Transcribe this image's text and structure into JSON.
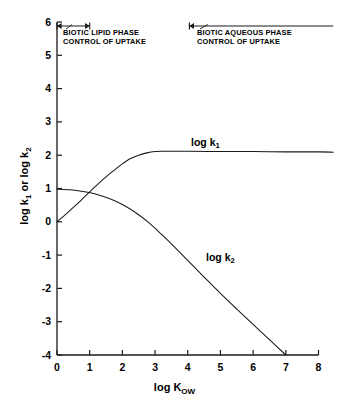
{
  "chart_data": {
    "type": "line",
    "title": "",
    "xlabel": "log K",
    "xlabel_sub": "OW",
    "ylabel": "log k",
    "ylabel_sub1": "1",
    "ylabel_mid": " or log k",
    "ylabel_sub2": "2",
    "xlim": [
      0,
      8
    ],
    "ylim": [
      -4,
      6
    ],
    "xticks": [
      "0",
      "1",
      "2",
      "3",
      "4",
      "5",
      "6",
      "7",
      "8"
    ],
    "yticks": [
      "6",
      "5",
      "4",
      "3",
      "2",
      "1",
      "0",
      "-1",
      "-2",
      "-3",
      "-4"
    ],
    "grid": false,
    "legend_position": "inline-curve-labels",
    "series": [
      {
        "name": "log k1",
        "label": "log k",
        "label_sub": "1",
        "color": "#1a1a1a",
        "x": [
          0.0,
          0.25,
          0.5,
          0.75,
          1.0,
          1.25,
          1.5,
          1.75,
          2.0,
          2.25,
          2.5,
          2.75,
          3.0,
          3.25,
          3.5,
          4.0,
          5.0,
          6.0,
          7.0,
          8.0,
          8.45
        ],
        "y": [
          0.0,
          0.21,
          0.43,
          0.66,
          0.9,
          1.13,
          1.35,
          1.55,
          1.74,
          1.9,
          2.0,
          2.07,
          2.11,
          2.12,
          2.12,
          2.12,
          2.11,
          2.11,
          2.1,
          2.1,
          2.09
        ]
      },
      {
        "name": "log k2",
        "label": "log k",
        "label_sub": "2",
        "color": "#1a1a1a",
        "x": [
          0.0,
          0.4,
          0.8,
          1.2,
          1.6,
          2.0,
          2.4,
          2.8,
          3.2,
          3.6,
          4.0,
          4.5,
          5.0,
          5.5,
          6.0,
          6.5,
          7.0
        ],
        "y": [
          0.98,
          0.96,
          0.91,
          0.83,
          0.7,
          0.52,
          0.28,
          -0.02,
          -0.38,
          -0.76,
          -1.16,
          -1.66,
          -2.15,
          -2.62,
          -3.08,
          -3.54,
          -4.0
        ]
      }
    ],
    "annotations": [
      {
        "name": "biotic-lipid-phase",
        "text_line1": "BIOTIC  LIPID  PHASE",
        "text_line2": "CONTROL OF UPTAKE",
        "range_x": [
          0.0,
          1.0
        ],
        "arrow_y": 5.88,
        "arrow_style": "double-headed"
      },
      {
        "name": "biotic-aqueous-phase",
        "text_line1": "BIOTIC  AQUEOUS  PHASE",
        "text_line2": "CONTROL OF UPTAKE",
        "range_x": [
          4.05,
          8.45
        ],
        "arrow_y": 5.88,
        "arrow_style": "left-headed"
      }
    ]
  },
  "colors": {
    "background": "#ffffff",
    "axis": "#1a1a1a",
    "curve": "#1a1a1a",
    "text": "#000000"
  }
}
